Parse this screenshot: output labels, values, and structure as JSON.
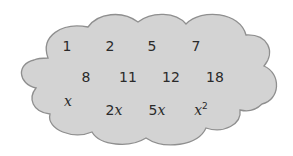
{
  "diagram": {
    "shape": "cloud",
    "colors": {
      "fill": "#d3d3d3",
      "stroke": "#8f8f8f",
      "text": "#2a2a2a",
      "background": "#ffffff"
    },
    "rows": [
      {
        "items": [
          {
            "text": "1"
          },
          {
            "text": "2"
          },
          {
            "text": "5"
          },
          {
            "text": "7"
          }
        ]
      },
      {
        "items": [
          {
            "text": "8"
          },
          {
            "text": "11"
          },
          {
            "text": "12"
          },
          {
            "text": "18"
          }
        ]
      },
      {
        "items": [
          {
            "coef": "",
            "var": "x",
            "exp": ""
          },
          {
            "coef": "2",
            "var": "x",
            "exp": ""
          },
          {
            "coef": "5",
            "var": "x",
            "exp": ""
          },
          {
            "coef": "",
            "var": "x",
            "exp": "2"
          }
        ]
      }
    ]
  }
}
